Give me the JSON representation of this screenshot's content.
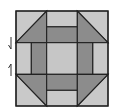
{
  "diagram": {
    "type": "quilt-block",
    "pattern": "churn-dash",
    "grid": {
      "rows": 3,
      "cols": 3
    },
    "colors": {
      "background": "#ffffff",
      "light": "#c9c9c9",
      "dark": "#8c8c8c",
      "center": "#c6c6c6",
      "outline": "#222222",
      "marker": "#333333"
    },
    "cells": [
      {
        "row": 0,
        "col": 0,
        "kind": "half-square-triangle",
        "dark_corner": "bottom-right"
      },
      {
        "row": 0,
        "col": 1,
        "kind": "strip-pair",
        "dark_side": "bottom"
      },
      {
        "row": 0,
        "col": 2,
        "kind": "half-square-triangle",
        "dark_corner": "bottom-left"
      },
      {
        "row": 1,
        "col": 0,
        "kind": "strip-pair",
        "dark_side": "right"
      },
      {
        "row": 1,
        "col": 1,
        "kind": "solid",
        "fill": "center"
      },
      {
        "row": 1,
        "col": 2,
        "kind": "strip-pair",
        "dark_side": "left"
      },
      {
        "row": 2,
        "col": 0,
        "kind": "half-square-triangle",
        "dark_corner": "top-right"
      },
      {
        "row": 2,
        "col": 1,
        "kind": "strip-pair",
        "dark_side": "top"
      },
      {
        "row": 2,
        "col": 2,
        "kind": "half-square-triangle",
        "dark_corner": "top-left"
      }
    ],
    "markers": [
      {
        "name": "seam-marker-down",
        "direction": "down"
      },
      {
        "name": "seam-marker-up",
        "direction": "up"
      }
    ]
  }
}
